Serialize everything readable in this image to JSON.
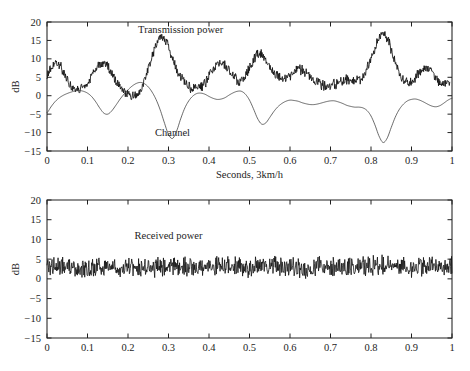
{
  "figure": {
    "name": "power-control-fading-figure",
    "background": "#ffffff",
    "ink_color": "#111111"
  },
  "chart_data": [
    {
      "id": "top",
      "type": "line",
      "title": "",
      "xlabel": "Seconds, 3km/h",
      "ylabel": "dB",
      "xlim": [
        0,
        1
      ],
      "ylim": [
        -15,
        20
      ],
      "xticks": [
        0,
        0.1,
        0.2,
        0.3,
        0.4,
        0.5,
        0.6,
        0.7,
        0.8,
        0.9,
        1
      ],
      "xticklabels": [
        "0",
        "0.1",
        "0.2",
        "0.3",
        "0.4",
        "0.5",
        "0.6",
        "0.7",
        "0.8",
        "0.9",
        "1"
      ],
      "yticks": [
        -15,
        -10,
        -5,
        0,
        5,
        10,
        15,
        20
      ],
      "yticklabels": [
        "-15",
        "-10",
        "-5",
        "0",
        "5",
        "10",
        "15",
        "20"
      ],
      "grid": false,
      "legend": "inline-annotations",
      "annotations": [
        {
          "text": "Transmission power",
          "x": 0.33,
          "y": 17.0
        },
        {
          "text": "Channel",
          "x": 0.31,
          "y": -11.0
        }
      ],
      "series": [
        {
          "name": "Transmission power",
          "style": "noisy",
          "x": [
            0.0,
            0.005,
            0.01,
            0.015,
            0.02,
            0.025,
            0.03,
            0.035,
            0.04,
            0.045,
            0.05,
            0.055,
            0.06,
            0.065,
            0.07,
            0.075,
            0.08,
            0.085,
            0.09,
            0.095,
            0.1,
            0.105,
            0.11,
            0.115,
            0.12,
            0.125,
            0.13,
            0.135,
            0.14,
            0.145,
            0.15,
            0.155,
            0.16,
            0.165,
            0.17,
            0.175,
            0.18,
            0.185,
            0.19,
            0.195,
            0.2,
            0.205,
            0.21,
            0.215,
            0.22,
            0.225,
            0.23,
            0.235,
            0.24,
            0.245,
            0.25,
            0.255,
            0.26,
            0.265,
            0.27,
            0.275,
            0.28,
            0.285,
            0.29,
            0.295,
            0.3,
            0.305,
            0.31,
            0.315,
            0.32,
            0.325,
            0.33,
            0.335,
            0.34,
            0.345,
            0.35,
            0.355,
            0.36,
            0.365,
            0.37,
            0.375,
            0.38,
            0.385,
            0.39,
            0.395,
            0.4,
            0.405,
            0.41,
            0.415,
            0.42,
            0.425,
            0.43,
            0.435,
            0.44,
            0.445,
            0.45,
            0.455,
            0.46,
            0.465,
            0.47,
            0.475,
            0.48,
            0.485,
            0.49,
            0.495,
            0.5,
            0.505,
            0.51,
            0.515,
            0.52,
            0.525,
            0.53,
            0.535,
            0.54,
            0.545,
            0.55,
            0.555,
            0.56,
            0.565,
            0.57,
            0.575,
            0.58,
            0.585,
            0.59,
            0.595,
            0.6,
            0.605,
            0.61,
            0.615,
            0.62,
            0.625,
            0.63,
            0.635,
            0.64,
            0.645,
            0.65,
            0.655,
            0.66,
            0.665,
            0.67,
            0.675,
            0.68,
            0.685,
            0.69,
            0.695,
            0.7,
            0.705,
            0.71,
            0.715,
            0.72,
            0.725,
            0.73,
            0.735,
            0.74,
            0.745,
            0.75,
            0.755,
            0.76,
            0.765,
            0.77,
            0.775,
            0.78,
            0.785,
            0.79,
            0.795,
            0.8,
            0.805,
            0.81,
            0.815,
            0.82,
            0.825,
            0.83,
            0.835,
            0.84,
            0.845,
            0.85,
            0.855,
            0.86,
            0.865,
            0.87,
            0.875,
            0.88,
            0.885,
            0.89,
            0.895,
            0.9,
            0.905,
            0.91,
            0.915,
            0.92,
            0.925,
            0.93,
            0.935,
            0.94,
            0.945,
            0.95,
            0.955,
            0.96,
            0.965,
            0.97,
            0.975,
            0.98,
            0.985,
            0.99,
            0.995,
            1.0
          ],
          "y": [
            5.0,
            6.4,
            7.6,
            8.3,
            8.8,
            8.6,
            8.4,
            7.6,
            6.3,
            5.2,
            4.3,
            3.5,
            2.8,
            2.2,
            2.0,
            2.2,
            1.9,
            2.3,
            2.0,
            2.6,
            3.1,
            3.9,
            5.0,
            6.2,
            7.3,
            8.1,
            8.6,
            8.3,
            8.7,
            8.4,
            7.9,
            7.0,
            6.0,
            5.0,
            4.1,
            3.3,
            2.5,
            1.8,
            1.2,
            0.7,
            0.3,
            0.1,
            -0.1,
            0.2,
            0.0,
            0.6,
            1.4,
            2.6,
            4.0,
            5.6,
            7.3,
            9.0,
            10.8,
            12.4,
            13.8,
            15.0,
            15.7,
            16.0,
            15.6,
            14.6,
            13.2,
            11.6,
            10.0,
            8.5,
            7.2,
            6.0,
            5.0,
            4.2,
            3.6,
            3.1,
            2.6,
            2.2,
            2.0,
            2.4,
            2.1,
            2.6,
            2.2,
            2.7,
            3.4,
            4.3,
            5.3,
            6.3,
            7.2,
            7.9,
            8.3,
            8.6,
            8.4,
            8.7,
            8.3,
            7.7,
            7.0,
            6.1,
            5.3,
            4.6,
            4.1,
            3.8,
            3.9,
            4.4,
            5.2,
            6.3,
            7.5,
            8.7,
            9.8,
            10.6,
            11.1,
            11.3,
            11.0,
            10.4,
            9.6,
            8.7,
            7.8,
            7.0,
            6.3,
            5.7,
            5.3,
            5.0,
            4.8,
            4.7,
            4.8,
            5.1,
            5.5,
            6.0,
            6.4,
            6.8,
            7.0,
            7.1,
            6.9,
            6.6,
            6.1,
            5.6,
            5.0,
            4.5,
            4.0,
            3.6,
            3.3,
            3.1,
            2.9,
            2.8,
            2.7,
            2.7,
            2.8,
            2.9,
            3.1,
            3.3,
            3.5,
            3.8,
            4.0,
            4.2,
            4.3,
            4.4,
            4.4,
            4.3,
            4.2,
            4.2,
            4.3,
            4.6,
            5.2,
            6.0,
            7.1,
            8.5,
            10.0,
            11.6,
            13.1,
            14.5,
            15.6,
            16.4,
            16.7,
            16.4,
            15.5,
            14.2,
            12.6,
            10.9,
            9.3,
            7.8,
            6.5,
            5.4,
            4.6,
            4.0,
            3.6,
            3.5,
            3.7,
            4.2,
            4.9,
            5.7,
            6.4,
            7.0,
            7.4,
            7.5,
            7.3,
            6.9,
            6.3,
            5.6,
            4.9,
            4.3,
            3.8,
            3.4,
            3.2,
            3.1,
            3.2,
            3.4
          ],
          "noise_amplitude_db": 1.1
        },
        {
          "name": "Channel",
          "style": "smooth",
          "x": [
            0.0,
            0.01,
            0.02,
            0.03,
            0.04,
            0.05,
            0.06,
            0.07,
            0.08,
            0.09,
            0.1,
            0.11,
            0.12,
            0.13,
            0.14,
            0.15,
            0.16,
            0.17,
            0.18,
            0.19,
            0.2,
            0.21,
            0.22,
            0.23,
            0.24,
            0.25,
            0.26,
            0.27,
            0.28,
            0.29,
            0.3,
            0.31,
            0.32,
            0.33,
            0.34,
            0.35,
            0.36,
            0.37,
            0.38,
            0.39,
            0.4,
            0.41,
            0.42,
            0.43,
            0.44,
            0.45,
            0.46,
            0.47,
            0.48,
            0.49,
            0.5,
            0.51,
            0.52,
            0.53,
            0.54,
            0.55,
            0.56,
            0.57,
            0.58,
            0.59,
            0.6,
            0.61,
            0.62,
            0.63,
            0.64,
            0.65,
            0.66,
            0.67,
            0.68,
            0.69,
            0.7,
            0.71,
            0.72,
            0.73,
            0.74,
            0.75,
            0.76,
            0.77,
            0.78,
            0.79,
            0.8,
            0.81,
            0.82,
            0.83,
            0.84,
            0.85,
            0.86,
            0.87,
            0.88,
            0.89,
            0.9,
            0.91,
            0.92,
            0.93,
            0.94,
            0.95,
            0.96,
            0.97,
            0.98,
            0.99,
            1.0
          ],
          "y": [
            -4.6,
            -3.0,
            -1.6,
            -0.6,
            0.1,
            0.6,
            1.0,
            1.3,
            1.4,
            1.2,
            0.7,
            -0.2,
            -1.6,
            -3.3,
            -4.7,
            -5.0,
            -4.1,
            -2.6,
            -1.0,
            0.4,
            1.6,
            2.6,
            3.3,
            3.6,
            3.3,
            2.4,
            0.9,
            -1.2,
            -4.0,
            -7.4,
            -10.5,
            -11.6,
            -9.6,
            -6.3,
            -3.4,
            -1.4,
            -0.1,
            0.6,
            0.7,
            0.4,
            -0.2,
            -0.7,
            -1.0,
            -0.9,
            -0.5,
            0.2,
            0.8,
            1.2,
            1.2,
            0.4,
            -1.2,
            -3.6,
            -6.2,
            -7.7,
            -7.4,
            -5.9,
            -4.3,
            -3.0,
            -2.1,
            -1.5,
            -1.2,
            -1.3,
            -1.5,
            -1.9,
            -2.2,
            -2.4,
            -2.4,
            -2.2,
            -1.9,
            -1.6,
            -1.4,
            -1.4,
            -1.7,
            -2.1,
            -2.6,
            -2.9,
            -3.1,
            -3.1,
            -3.3,
            -4.0,
            -5.5,
            -8.0,
            -11.0,
            -12.7,
            -11.5,
            -8.6,
            -5.8,
            -3.7,
            -2.3,
            -1.4,
            -1.0,
            -0.9,
            -1.2,
            -1.7,
            -2.3,
            -2.8,
            -3.0,
            -2.7,
            -2.0,
            -1.2,
            -0.7
          ]
        }
      ]
    },
    {
      "id": "bottom",
      "type": "line",
      "title": "",
      "xlabel": "",
      "ylabel": "dB",
      "xlim": [
        0,
        1
      ],
      "ylim": [
        -15,
        20
      ],
      "xticks": [
        0,
        0.1,
        0.2,
        0.3,
        0.4,
        0.5,
        0.6,
        0.7,
        0.8,
        0.9,
        1
      ],
      "xticklabels": [
        "0",
        "0.1",
        "0.2",
        "0.3",
        "0.4",
        "0.5",
        "0.6",
        "0.7",
        "0.8",
        "0.9",
        "1"
      ],
      "yticks": [
        -15,
        -10,
        -5,
        0,
        5,
        10,
        15,
        20
      ],
      "yticklabels": [
        "-15",
        "-10",
        "-5",
        "0",
        "5",
        "10",
        "15",
        "20"
      ],
      "grid": false,
      "legend": "inline-annotations",
      "annotations": [
        {
          "text": "Received power",
          "x": 0.3,
          "y": 10.0
        }
      ],
      "series": [
        {
          "name": "Received power",
          "style": "noisy-flat",
          "mean_db": 3.0,
          "noise_amplitude_db": 2.0,
          "x": [
            0.0,
            0.05,
            0.1,
            0.15,
            0.2,
            0.25,
            0.3,
            0.35,
            0.4,
            0.45,
            0.5,
            0.55,
            0.6,
            0.65,
            0.7,
            0.75,
            0.8,
            0.85,
            0.9,
            0.95,
            1.0
          ],
          "y": [
            3.3,
            3.1,
            2.7,
            3.2,
            3.0,
            2.6,
            3.2,
            3.0,
            3.1,
            3.2,
            3.0,
            3.3,
            2.9,
            2.8,
            3.0,
            3.1,
            3.2,
            3.4,
            3.0,
            3.1,
            3.2
          ]
        }
      ]
    }
  ]
}
